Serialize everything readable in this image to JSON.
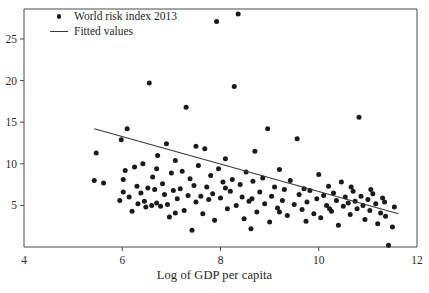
{
  "chart_data": {
    "type": "scatter",
    "title": "",
    "xlabel": "Log of GDP per capita",
    "ylabel": "",
    "xlim": [
      4,
      12
    ],
    "ylim": [
      0,
      28.6
    ],
    "xticks": [
      4,
      6,
      8,
      10,
      12
    ],
    "yticks": [
      5,
      10,
      15,
      20,
      25
    ],
    "grid": false,
    "legend_position": "top-left",
    "series": [
      {
        "name": "World risk index 2013",
        "marker": "filled-circle",
        "color": "#1a1a1a",
        "points": [
          [
            5.43,
            8.0
          ],
          [
            5.47,
            11.3
          ],
          [
            5.62,
            7.7
          ],
          [
            5.95,
            5.6
          ],
          [
            5.98,
            12.9
          ],
          [
            6.02,
            6.6
          ],
          [
            6.06,
            9.2
          ],
          [
            6.1,
            14.2
          ],
          [
            6.14,
            6.0
          ],
          [
            6.2,
            4.3
          ],
          [
            6.25,
            9.6
          ],
          [
            6.3,
            7.3
          ],
          [
            6.32,
            5.2
          ],
          [
            6.38,
            6.5
          ],
          [
            6.42,
            10.0
          ],
          [
            6.45,
            5.5
          ],
          [
            6.48,
            4.8
          ],
          [
            6.52,
            7.1
          ],
          [
            6.55,
            19.7
          ],
          [
            6.6,
            5.0
          ],
          [
            6.62,
            8.4
          ],
          [
            6.66,
            6.9
          ],
          [
            6.7,
            5.3
          ],
          [
            6.72,
            11.0
          ],
          [
            6.78,
            4.9
          ],
          [
            6.82,
            7.6
          ],
          [
            6.86,
            6.3
          ],
          [
            6.9,
            12.4
          ],
          [
            6.92,
            5.1
          ],
          [
            6.96,
            3.6
          ],
          [
            7.0,
            8.9
          ],
          [
            7.04,
            6.8
          ],
          [
            7.08,
            10.4
          ],
          [
            7.12,
            5.8
          ],
          [
            7.18,
            7.0
          ],
          [
            7.22,
            9.1
          ],
          [
            7.26,
            4.4
          ],
          [
            7.3,
            16.8
          ],
          [
            7.34,
            6.2
          ],
          [
            7.38,
            8.2
          ],
          [
            7.42,
            2.0
          ],
          [
            7.46,
            7.4
          ],
          [
            7.5,
            5.4
          ],
          [
            7.55,
            9.8
          ],
          [
            7.6,
            6.1
          ],
          [
            7.64,
            4.0
          ],
          [
            7.68,
            11.8
          ],
          [
            7.72,
            7.2
          ],
          [
            7.76,
            5.7
          ],
          [
            7.8,
            8.6
          ],
          [
            7.84,
            6.4
          ],
          [
            7.88,
            3.2
          ],
          [
            7.92,
            27.1
          ],
          [
            7.96,
            9.4
          ],
          [
            8.0,
            5.9
          ],
          [
            8.05,
            7.8
          ],
          [
            8.1,
            10.6
          ],
          [
            8.14,
            4.6
          ],
          [
            8.2,
            6.7
          ],
          [
            8.24,
            8.1
          ],
          [
            8.28,
            19.3
          ],
          [
            8.32,
            5.0
          ],
          [
            8.36,
            28.0
          ],
          [
            8.4,
            7.5
          ],
          [
            8.44,
            6.0
          ],
          [
            8.48,
            3.4
          ],
          [
            8.52,
            9.0
          ],
          [
            8.58,
            5.5
          ],
          [
            8.62,
            2.2
          ],
          [
            8.66,
            7.9
          ],
          [
            8.7,
            11.5
          ],
          [
            8.74,
            4.2
          ],
          [
            8.8,
            6.6
          ],
          [
            8.86,
            8.3
          ],
          [
            8.9,
            5.2
          ],
          [
            8.96,
            14.2
          ],
          [
            9.0,
            3.0
          ],
          [
            9.04,
            6.1
          ],
          [
            9.1,
            7.2
          ],
          [
            9.16,
            4.7
          ],
          [
            9.2,
            9.3
          ],
          [
            9.26,
            5.6
          ],
          [
            9.3,
            6.9
          ],
          [
            9.36,
            3.8
          ],
          [
            9.42,
            8.0
          ],
          [
            9.5,
            5.1
          ],
          [
            9.56,
            13.0
          ],
          [
            9.6,
            6.3
          ],
          [
            9.66,
            4.5
          ],
          [
            9.7,
            7.0
          ],
          [
            9.76,
            5.4
          ],
          [
            9.82,
            6.8
          ],
          [
            9.9,
            4.0
          ],
          [
            9.96,
            5.8
          ],
          [
            10.0,
            8.7
          ],
          [
            10.04,
            3.5
          ],
          [
            10.1,
            6.2
          ],
          [
            10.16,
            5.0
          ],
          [
            10.2,
            7.3
          ],
          [
            10.26,
            4.3
          ],
          [
            10.3,
            6.5
          ],
          [
            10.36,
            5.6
          ],
          [
            10.4,
            2.6
          ],
          [
            10.46,
            7.8
          ],
          [
            10.5,
            4.9
          ],
          [
            10.54,
            6.0
          ],
          [
            10.6,
            5.3
          ],
          [
            10.64,
            3.9
          ],
          [
            10.7,
            6.7
          ],
          [
            10.74,
            5.5
          ],
          [
            10.78,
            4.6
          ],
          [
            10.82,
            15.6
          ],
          [
            10.86,
            6.1
          ],
          [
            10.9,
            5.0
          ],
          [
            10.94,
            3.3
          ],
          [
            11.0,
            5.7
          ],
          [
            11.04,
            4.4
          ],
          [
            11.1,
            6.4
          ],
          [
            11.16,
            5.2
          ],
          [
            11.2,
            2.8
          ],
          [
            11.26,
            4.1
          ],
          [
            11.3,
            5.9
          ],
          [
            11.36,
            3.7
          ],
          [
            11.42,
            0.2
          ],
          [
            11.5,
            2.4
          ],
          [
            11.54,
            4.8
          ],
          [
            6.02,
            8.1
          ],
          [
            6.7,
            9.4
          ],
          [
            7.08,
            4.1
          ],
          [
            7.5,
            12.1
          ],
          [
            8.1,
            7.1
          ],
          [
            8.64,
            5.8
          ],
          [
            9.2,
            4.2
          ],
          [
            9.74,
            3.1
          ],
          [
            10.22,
            4.6
          ],
          [
            10.66,
            7.2
          ],
          [
            11.06,
            6.9
          ],
          [
            11.34,
            5.4
          ]
        ]
      }
    ],
    "fit_line": {
      "name": "Fitted values",
      "color": "#3a3a3a",
      "x_start": 5.43,
      "y_start": 14.2,
      "x_end": 11.62,
      "y_end": 4.0
    }
  },
  "legend": {
    "entries": [
      {
        "label": "World risk index 2013",
        "key": "filled-circle-marker"
      },
      {
        "label": "Fitted values",
        "key": "line-segment-marker"
      }
    ]
  },
  "axes": {
    "x_title": "Log of GDP per capita",
    "x_tick_labels": [
      "4",
      "6",
      "8",
      "10",
      "12"
    ],
    "y_tick_labels": [
      "5",
      "10",
      "15",
      "20",
      "25"
    ]
  }
}
